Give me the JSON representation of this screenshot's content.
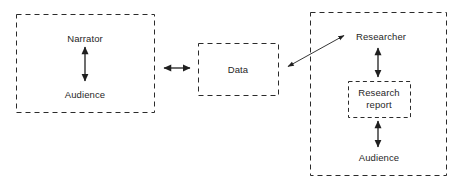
{
  "diagram": {
    "stroke_color": "#2b2b2b",
    "background_color": "#ffffff",
    "boxes": [
      {
        "name": "narrator-audience-group",
        "label": "",
        "x": 16,
        "y": 14,
        "w": 138,
        "h": 98,
        "dashed": true
      },
      {
        "name": "data-box",
        "label": "Data",
        "x": 198,
        "y": 43,
        "w": 80,
        "h": 52,
        "dashed": true
      },
      {
        "name": "researcher-group",
        "label": "",
        "x": 310,
        "y": 12,
        "w": 136,
        "h": 163,
        "dashed": true
      },
      {
        "name": "research-report-box",
        "label": "Research report",
        "x": 348,
        "y": 81,
        "w": 62,
        "h": 36,
        "dashed": true
      }
    ],
    "labels": {
      "narrator": "Narrator",
      "audience_left": "Audience",
      "data": "Data",
      "researcher": "Researcher",
      "research_report_line1": "Research",
      "research_report_line2": "report",
      "audience_right": "Audience"
    },
    "arrows": [
      {
        "name": "narrator-audience-arrow",
        "type": "vertical",
        "double_headed": true,
        "x1": 85,
        "y1": 47,
        "x2": 85,
        "y2": 81
      },
      {
        "name": "narrator-group-to-data-arrow",
        "type": "horizontal",
        "double_headed": true,
        "x1": 163,
        "y1": 68,
        "x2": 191,
        "y2": 68
      },
      {
        "name": "data-to-researcher-arrow",
        "type": "diagonal",
        "double_headed": true,
        "x1": 287,
        "y1": 67,
        "x2": 345,
        "y2": 35
      },
      {
        "name": "researcher-report-arrow",
        "type": "vertical",
        "double_headed": true,
        "x1": 378,
        "y1": 48,
        "x2": 378,
        "y2": 77
      },
      {
        "name": "report-audience-arrow",
        "type": "vertical",
        "double_headed": true,
        "x1": 378,
        "y1": 121,
        "x2": 378,
        "y2": 147
      }
    ]
  }
}
